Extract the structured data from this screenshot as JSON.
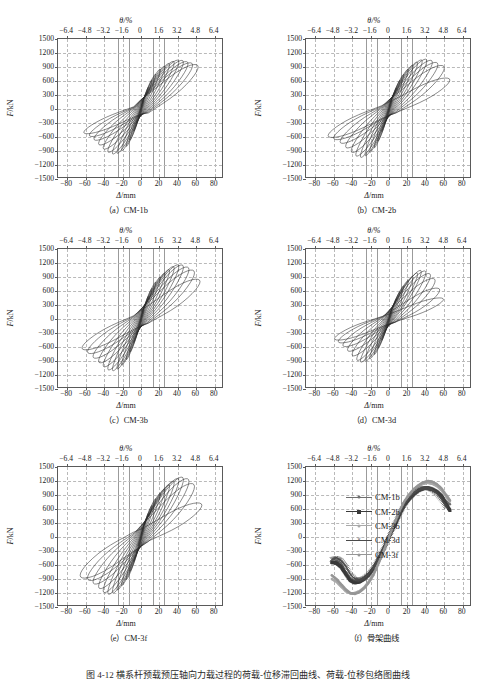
{
  "figure": {
    "caption": "图 4-12  横系杆预载预压轴向力载过程的荷载-位移滞回曲线、荷载-位移包络图曲线",
    "panels": [
      {
        "key": "a",
        "caption": "（a）CM-1b",
        "specimen": "CM-1b"
      },
      {
        "key": "b",
        "caption": "（b）CM-2b",
        "specimen": "CM-2b"
      },
      {
        "key": "c",
        "caption": "（c）CM-3b",
        "specimen": "CM-3b"
      },
      {
        "key": "d",
        "caption": "（d）CM-3d",
        "specimen": "CM-3d"
      },
      {
        "key": "e",
        "caption": "（e）CM-3f",
        "specimen": "CM-3f"
      },
      {
        "key": "f",
        "caption": "（f）骨架曲线",
        "specimen": "骨架曲线"
      }
    ]
  },
  "axes": {
    "top_title": "θ/%",
    "bottom_title": "Δ/mm",
    "y_title": "F/kN",
    "x_ticks": [
      -80,
      -60,
      -40,
      -20,
      0,
      20,
      40,
      60,
      80
    ],
    "x_tick_labels": [
      "−80",
      "−60",
      "−40",
      "−20",
      "0",
      "20",
      "40",
      "60",
      "80"
    ],
    "theta_ticks": [
      -6.4,
      -4.8,
      -3.2,
      -1.6,
      0,
      1.6,
      3.2,
      4.8,
      6.4
    ],
    "theta_tick_labels": [
      "−6.4",
      "−4.8",
      "−3.2",
      "−1.6",
      "0",
      "1.6",
      "3.2",
      "4.8",
      "6.4"
    ],
    "y_ticks": [
      1500,
      1200,
      900,
      600,
      300,
      0,
      -300,
      -600,
      -900,
      -1200,
      -1500
    ],
    "y_tick_labels": [
      "1500",
      "1200",
      "900",
      "600",
      "300",
      "0",
      "−300",
      "−600",
      "−900",
      "−1200",
      "−1500"
    ],
    "xlim": [
      -90,
      90
    ],
    "ylim": [
      -1500,
      1500
    ],
    "theta_to_mm": 12.5,
    "grid": "dashed",
    "solid_guide_lines_mm": [
      -25,
      -12.5,
      12.5,
      25
    ]
  },
  "legend": {
    "position": "inside-right",
    "entries": [
      {
        "label": "CM-1b",
        "marker": "dot",
        "color": "#6f6f6f"
      },
      {
        "label": "CM-2b",
        "marker": "square",
        "color": "#3a3a3a"
      },
      {
        "label": "CM-3b",
        "marker": "dot-light",
        "color": "#a9a9a9"
      },
      {
        "label": "CM-3d",
        "marker": "cross",
        "color": "#4a4a4a"
      },
      {
        "label": "CM-3f",
        "marker": "dot-light2",
        "color": "#969696"
      }
    ]
  },
  "chart_data": [
    {
      "type": "line",
      "id": "panel-a",
      "title": "（a）CM-1b",
      "xlabel": "Δ/mm",
      "ylabel": "F/kN",
      "xlim": [
        -90,
        90
      ],
      "ylim": [
        -1500,
        1500
      ],
      "grid": true,
      "description": "Cyclic load-displacement hysteresis loops, specimen CM-1b",
      "loops": [
        {
          "amp_mm": 3,
          "fpos": 180,
          "fneg": -170,
          "tilt": 0.8
        },
        {
          "amp_mm": 5,
          "fpos": 300,
          "fneg": -290,
          "tilt": 0.8
        },
        {
          "amp_mm": 8,
          "fpos": 460,
          "fneg": -470,
          "tilt": 0.78
        },
        {
          "amp_mm": 12,
          "fpos": 620,
          "fneg": -660,
          "tilt": 0.74
        },
        {
          "amp_mm": 16,
          "fpos": 740,
          "fneg": -790,
          "tilt": 0.7
        },
        {
          "amp_mm": 21,
          "fpos": 840,
          "fneg": -880,
          "tilt": 0.66
        },
        {
          "amp_mm": 26,
          "fpos": 900,
          "fneg": -930,
          "tilt": 0.62
        },
        {
          "amp_mm": 31,
          "fpos": 950,
          "fneg": -940,
          "tilt": 0.58
        },
        {
          "amp_mm": 36,
          "fpos": 990,
          "fneg": -900,
          "tilt": 0.54
        },
        {
          "amp_mm": 41,
          "fpos": 1010,
          "fneg": -830,
          "tilt": 0.5
        },
        {
          "amp_mm": 46,
          "fpos": 1000,
          "fneg": -740,
          "tilt": 0.46
        },
        {
          "amp_mm": 51,
          "fpos": 970,
          "fneg": -640,
          "tilt": 0.42
        },
        {
          "amp_mm": 56,
          "fpos": 940,
          "fneg": -560,
          "tilt": 0.38
        },
        {
          "amp_mm": 62,
          "fpos": 900,
          "fneg": -500,
          "tilt": 0.34
        }
      ]
    },
    {
      "type": "line",
      "id": "panel-b",
      "title": "（b）CM-2b",
      "xlabel": "Δ/mm",
      "ylabel": "F/kN",
      "xlim": [
        -90,
        90
      ],
      "ylim": [
        -1500,
        1500
      ],
      "grid": true,
      "description": "Cyclic load-displacement hysteresis loops, specimen CM-2b",
      "loops": [
        {
          "amp_mm": 3,
          "fpos": 170,
          "fneg": -180,
          "tilt": 0.8
        },
        {
          "amp_mm": 5,
          "fpos": 290,
          "fneg": -300,
          "tilt": 0.8
        },
        {
          "amp_mm": 8,
          "fpos": 450,
          "fneg": -480,
          "tilt": 0.78
        },
        {
          "amp_mm": 12,
          "fpos": 610,
          "fneg": -680,
          "tilt": 0.74
        },
        {
          "amp_mm": 16,
          "fpos": 730,
          "fneg": -820,
          "tilt": 0.7
        },
        {
          "amp_mm": 21,
          "fpos": 840,
          "fneg": -910,
          "tilt": 0.66
        },
        {
          "amp_mm": 26,
          "fpos": 920,
          "fneg": -980,
          "tilt": 0.62
        },
        {
          "amp_mm": 31,
          "fpos": 980,
          "fneg": -1010,
          "tilt": 0.58
        },
        {
          "amp_mm": 36,
          "fpos": 1020,
          "fneg": -980,
          "tilt": 0.54
        },
        {
          "amp_mm": 41,
          "fpos": 1030,
          "fneg": -900,
          "tilt": 0.5
        },
        {
          "amp_mm": 47,
          "fpos": 1000,
          "fneg": -800,
          "tilt": 0.45
        },
        {
          "amp_mm": 53,
          "fpos": 950,
          "fneg": -700,
          "tilt": 0.4
        },
        {
          "amp_mm": 60,
          "fpos": 880,
          "fneg": -620,
          "tilt": 0.34
        },
        {
          "amp_mm": 66,
          "fpos": 620,
          "fneg": -570,
          "tilt": 0.28
        }
      ]
    },
    {
      "type": "line",
      "id": "panel-c",
      "title": "（c）CM-3b",
      "xlabel": "Δ/mm",
      "ylabel": "F/kN",
      "xlim": [
        -90,
        90
      ],
      "ylim": [
        -1500,
        1500
      ],
      "grid": true,
      "description": "Cyclic load-displacement hysteresis loops, specimen CM-3b",
      "loops": [
        {
          "amp_mm": 3,
          "fpos": 185,
          "fneg": -185,
          "tilt": 0.8
        },
        {
          "amp_mm": 5,
          "fpos": 310,
          "fneg": -310,
          "tilt": 0.8
        },
        {
          "amp_mm": 8,
          "fpos": 480,
          "fneg": -500,
          "tilt": 0.78
        },
        {
          "amp_mm": 12,
          "fpos": 650,
          "fneg": -700,
          "tilt": 0.74
        },
        {
          "amp_mm": 16,
          "fpos": 780,
          "fneg": -860,
          "tilt": 0.7
        },
        {
          "amp_mm": 21,
          "fpos": 880,
          "fneg": -970,
          "tilt": 0.66
        },
        {
          "amp_mm": 26,
          "fpos": 960,
          "fneg": -1050,
          "tilt": 0.62
        },
        {
          "amp_mm": 31,
          "fpos": 1030,
          "fneg": -1080,
          "tilt": 0.58
        },
        {
          "amp_mm": 36,
          "fpos": 1090,
          "fneg": -1060,
          "tilt": 0.54
        },
        {
          "amp_mm": 41,
          "fpos": 1120,
          "fneg": -990,
          "tilt": 0.5
        },
        {
          "amp_mm": 46,
          "fpos": 1110,
          "fneg": -900,
          "tilt": 0.45
        },
        {
          "amp_mm": 52,
          "fpos": 1060,
          "fneg": -800,
          "tilt": 0.4
        },
        {
          "amp_mm": 58,
          "fpos": 990,
          "fneg": -700,
          "tilt": 0.35
        },
        {
          "amp_mm": 64,
          "fpos": 800,
          "fneg": -620,
          "tilt": 0.3
        }
      ]
    },
    {
      "type": "line",
      "id": "panel-d",
      "title": "（d）CM-3d",
      "xlabel": "Δ/mm",
      "ylabel": "F/kN",
      "xlim": [
        -90,
        90
      ],
      "ylim": [
        -1500,
        1500
      ],
      "grid": true,
      "description": "Cyclic load-displacement hysteresis loops, specimen CM-3d",
      "loops": [
        {
          "amp_mm": 3,
          "fpos": 160,
          "fneg": -160,
          "tilt": 0.8
        },
        {
          "amp_mm": 5,
          "fpos": 280,
          "fneg": -280,
          "tilt": 0.8
        },
        {
          "amp_mm": 8,
          "fpos": 430,
          "fneg": -450,
          "tilt": 0.78
        },
        {
          "amp_mm": 12,
          "fpos": 580,
          "fneg": -620,
          "tilt": 0.74
        },
        {
          "amp_mm": 16,
          "fpos": 700,
          "fneg": -750,
          "tilt": 0.7
        },
        {
          "amp_mm": 21,
          "fpos": 810,
          "fneg": -840,
          "tilt": 0.66
        },
        {
          "amp_mm": 26,
          "fpos": 890,
          "fneg": -890,
          "tilt": 0.62
        },
        {
          "amp_mm": 31,
          "fpos": 960,
          "fneg": -900,
          "tilt": 0.58
        },
        {
          "amp_mm": 35,
          "fpos": 1010,
          "fneg": -860,
          "tilt": 0.54
        },
        {
          "amp_mm": 40,
          "fpos": 990,
          "fneg": -760,
          "tilt": 0.48
        },
        {
          "amp_mm": 45,
          "fpos": 930,
          "fneg": -660,
          "tilt": 0.42
        },
        {
          "amp_mm": 50,
          "fpos": 820,
          "fneg": -560,
          "tilt": 0.36
        },
        {
          "amp_mm": 55,
          "fpos": 620,
          "fneg": -480,
          "tilt": 0.3
        },
        {
          "amp_mm": 59,
          "fpos": 420,
          "fneg": -420,
          "tilt": 0.25
        }
      ]
    },
    {
      "type": "line",
      "id": "panel-e",
      "title": "（e）CM-3f",
      "xlabel": "Δ/mm",
      "ylabel": "F/kN",
      "xlim": [
        -90,
        90
      ],
      "ylim": [
        -1500,
        1500
      ],
      "grid": true,
      "description": "Cyclic load-displacement hysteresis loops, specimen CM-3f",
      "loops": [
        {
          "amp_mm": 3,
          "fpos": 190,
          "fneg": -190,
          "tilt": 0.8
        },
        {
          "amp_mm": 5,
          "fpos": 320,
          "fneg": -330,
          "tilt": 0.8
        },
        {
          "amp_mm": 8,
          "fpos": 500,
          "fneg": -520,
          "tilt": 0.78
        },
        {
          "amp_mm": 12,
          "fpos": 670,
          "fneg": -730,
          "tilt": 0.74
        },
        {
          "amp_mm": 16,
          "fpos": 810,
          "fneg": -900,
          "tilt": 0.7
        },
        {
          "amp_mm": 21,
          "fpos": 920,
          "fneg": -1020,
          "tilt": 0.66
        },
        {
          "amp_mm": 26,
          "fpos": 1010,
          "fneg": -1110,
          "tilt": 0.62
        },
        {
          "amp_mm": 31,
          "fpos": 1090,
          "fneg": -1170,
          "tilt": 0.58
        },
        {
          "amp_mm": 36,
          "fpos": 1160,
          "fneg": -1190,
          "tilt": 0.54
        },
        {
          "amp_mm": 41,
          "fpos": 1210,
          "fneg": -1150,
          "tilt": 0.5
        },
        {
          "amp_mm": 46,
          "fpos": 1230,
          "fneg": -1060,
          "tilt": 0.45
        },
        {
          "amp_mm": 52,
          "fpos": 1190,
          "fneg": -960,
          "tilt": 0.4
        },
        {
          "amp_mm": 58,
          "fpos": 1080,
          "fneg": -880,
          "tilt": 0.34
        },
        {
          "amp_mm": 66,
          "fpos": 680,
          "fneg": -820,
          "tilt": 0.26
        }
      ]
    },
    {
      "type": "line",
      "id": "panel-f",
      "title": "（f）骨架曲线",
      "xlabel": "Δ/mm",
      "ylabel": "F/kN",
      "xlim": [
        -90,
        90
      ],
      "ylim": [
        -1500,
        1500
      ],
      "grid": true,
      "description": "Skeleton (backbone) curves for all five specimens",
      "x": [
        -62,
        -57,
        -52,
        -47,
        -42,
        -37,
        -32,
        -27,
        -22,
        -17,
        -12,
        -8,
        -4,
        0,
        4,
        8,
        12,
        17,
        22,
        27,
        32,
        37,
        42,
        47,
        52,
        57,
        62,
        66
      ],
      "series": [
        {
          "name": "CM-1b",
          "color": "#6f6f6f",
          "marker": "dot",
          "values": [
            -560,
            -520,
            -560,
            -760,
            -900,
            -950,
            -940,
            -870,
            -790,
            -660,
            -480,
            -330,
            -170,
            0,
            180,
            340,
            520,
            700,
            830,
            930,
            1000,
            1030,
            1030,
            1010,
            960,
            880,
            760,
            700
          ]
        },
        {
          "name": "CM-2b",
          "color": "#3a3a3a",
          "marker": "square",
          "values": [
            -540,
            -560,
            -640,
            -790,
            -930,
            -980,
            -960,
            -900,
            -810,
            -680,
            -500,
            -350,
            -180,
            0,
            175,
            330,
            510,
            690,
            820,
            920,
            1000,
            1040,
            1050,
            1020,
            970,
            880,
            700,
            570
          ]
        },
        {
          "name": "CM-3b",
          "color": "#a9a9a9",
          "marker": "dot-light",
          "values": [
            -900,
            -960,
            -1060,
            -1160,
            -1210,
            -1200,
            -1160,
            -1080,
            -960,
            -800,
            -580,
            -400,
            -200,
            0,
            200,
            380,
            570,
            760,
            900,
            1010,
            1090,
            1140,
            1160,
            1140,
            1090,
            1000,
            860,
            760
          ]
        },
        {
          "name": "CM-3d",
          "color": "#4a4a4a",
          "marker": "cross",
          "values": [
            -480,
            -450,
            -500,
            -620,
            -800,
            -900,
            -920,
            -880,
            -800,
            -670,
            -490,
            -340,
            -175,
            0,
            180,
            345,
            520,
            700,
            840,
            940,
            1010,
            1050,
            1050,
            1010,
            930,
            810,
            640,
            null
          ]
        },
        {
          "name": "CM-3f",
          "color": "#969696",
          "marker": "dot-light2",
          "values": [
            -820,
            -900,
            -1010,
            -1120,
            -1200,
            -1220,
            -1180,
            -1100,
            -980,
            -820,
            -600,
            -410,
            -205,
            0,
            205,
            390,
            585,
            775,
            915,
            1030,
            1110,
            1170,
            1200,
            1185,
            1130,
            1040,
            900,
            790
          ]
        }
      ]
    }
  ]
}
